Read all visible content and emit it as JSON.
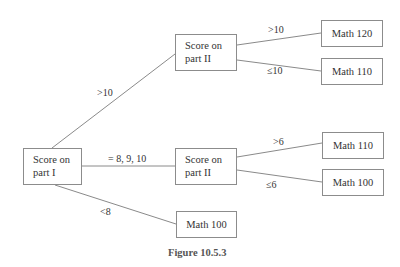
{
  "nodes": {
    "root": {
      "line1": "Score on",
      "line2": "part I"
    },
    "part2_top": {
      "line1": "Score on",
      "line2": "part II"
    },
    "part2_mid": {
      "line1": "Score on",
      "line2": "part II"
    },
    "math120": {
      "label": "Math 120"
    },
    "math110_top": {
      "label": "Math 110"
    },
    "math110_mid": {
      "label": "Math 110"
    },
    "math100_mid": {
      "label": "Math 100"
    },
    "math100_bottom": {
      "label": "Math 100"
    }
  },
  "edges": {
    "root_to_part2_top": ">10",
    "root_to_part2_mid": "= 8, 9, 10",
    "root_to_math100_bottom": "<8",
    "part2_top_to_math120": ">10",
    "part2_top_to_math110": "≤10",
    "part2_mid_to_math110": ">6",
    "part2_mid_to_math100": "≤6"
  },
  "caption": "Figure 10.5.3"
}
